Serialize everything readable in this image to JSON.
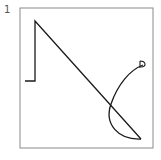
{
  "figure": {
    "label": "1",
    "frame": {
      "x": 20,
      "y": 8,
      "width": 133,
      "height": 140,
      "stroke": "#8a8a8a"
    },
    "path": {
      "stroke": "#1a1a1a",
      "segments": [
        {
          "type": "line",
          "from": [
            25,
            81
          ],
          "to": [
            35,
            81
          ]
        },
        {
          "type": "line",
          "from": [
            35,
            81
          ],
          "to": [
            35,
            21
          ]
        },
        {
          "type": "line",
          "from": [
            35,
            21
          ],
          "to": [
            141,
            139
          ]
        },
        {
          "type": "curve",
          "from": [
            141,
            139
          ],
          "to": [
            143,
            65
          ],
          "via": [
            110,
            115
          ]
        }
      ],
      "end_marker": "small-loop"
    }
  }
}
